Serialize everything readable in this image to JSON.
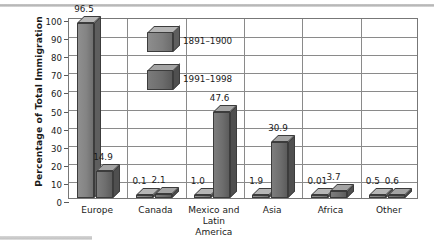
{
  "chart_data": {
    "type": "bar",
    "title": "",
    "xlabel": "",
    "ylabel": "Percentage of Total Immigration",
    "ylim": [
      0,
      100
    ],
    "ytick_labels": [
      "100",
      "90",
      "80",
      "70",
      "60",
      "50",
      "40",
      "30",
      "20",
      "10",
      "0"
    ],
    "grid": true,
    "legend_position": "inside-top-center",
    "categories": [
      "Europe",
      "Canada",
      "Mexico and Latin America",
      "Asia",
      "Africa",
      "Other"
    ],
    "series": [
      {
        "name": "1891–1900",
        "values": [
          96.5,
          0.1,
          1.0,
          1.9,
          0.01,
          0.5
        ],
        "value_labels": [
          "96.5",
          "0.1",
          "1.0",
          "1.9",
          "0.01",
          "0.5"
        ]
      },
      {
        "name": "1991–1998",
        "values": [
          14.9,
          2.1,
          47.6,
          30.9,
          3.7,
          0.6
        ],
        "value_labels": [
          "14.9",
          "2.1",
          "47.6",
          "30.9",
          "3.7",
          "0.6"
        ]
      }
    ],
    "colors": {
      "series1_face": "#848484",
      "series2_face": "#6e6e6e",
      "top_face": "#b6b6b6",
      "side_face": "#5e5e5e",
      "grid": "#8a8a8a",
      "frame": "#777777",
      "text": "#1a1a1a"
    }
  },
  "category_labels": [
    {
      "line1": "Europe",
      "line2": ""
    },
    {
      "line1": "Canada",
      "line2": ""
    },
    {
      "line1": "Mexico and",
      "line2": "Latin America"
    },
    {
      "line1": "Asia",
      "line2": ""
    },
    {
      "line1": "Africa",
      "line2": ""
    },
    {
      "line1": "Other",
      "line2": ""
    }
  ]
}
